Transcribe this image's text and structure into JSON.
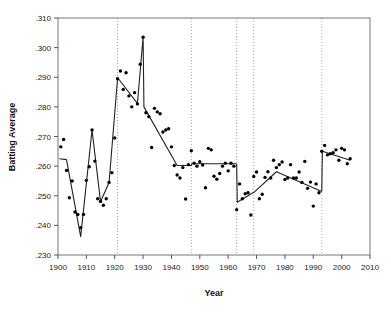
{
  "chart_data": {
    "type": "scatter",
    "title": "",
    "xlabel": "Year",
    "ylabel": "Batting Average",
    "xlim": [
      1900,
      2010
    ],
    "ylim": [
      0.23,
      0.31
    ],
    "xticks": [
      1900,
      1910,
      1920,
      1930,
      1940,
      1950,
      1960,
      1970,
      1980,
      1990,
      2000,
      2010
    ],
    "xtick_labels": [
      "1900",
      "1910",
      "1920",
      "1930",
      "1940",
      "1950",
      "1960",
      "1970",
      "1980",
      "1990",
      "2000",
      "2010"
    ],
    "yticks": [
      0.23,
      0.24,
      0.25,
      0.26,
      0.27,
      0.28,
      0.29,
      0.3,
      0.31
    ],
    "ytick_labels": [
      ".230",
      ".240",
      ".250",
      ".260",
      ".270",
      ".280",
      ".290",
      ".300",
      ".310"
    ],
    "grid": false,
    "legend": "none",
    "changepoints": [
      1921,
      1947,
      1963,
      1969,
      1993
    ],
    "changepoint_style": "dotted-vertical",
    "series": [
      {
        "name": "Observed batting average",
        "marker": "filled-circle",
        "color": "#000000",
        "x": [
          1901,
          1902,
          1903,
          1904,
          1905,
          1906,
          1907,
          1908,
          1909,
          1910,
          1911,
          1912,
          1913,
          1914,
          1915,
          1916,
          1917,
          1918,
          1919,
          1920,
          1921,
          1922,
          1923,
          1924,
          1925,
          1926,
          1927,
          1928,
          1929,
          1930,
          1931,
          1932,
          1933,
          1934,
          1935,
          1936,
          1937,
          1938,
          1939,
          1940,
          1941,
          1942,
          1943,
          1944,
          1945,
          1946,
          1947,
          1948,
          1949,
          1950,
          1951,
          1952,
          1953,
          1954,
          1955,
          1956,
          1957,
          1958,
          1959,
          1960,
          1961,
          1962,
          1963,
          1964,
          1965,
          1966,
          1967,
          1968,
          1969,
          1970,
          1971,
          1972,
          1973,
          1974,
          1975,
          1976,
          1977,
          1978,
          1979,
          1980,
          1981,
          1982,
          1983,
          1984,
          1985,
          1986,
          1987,
          1988,
          1989,
          1990,
          1991,
          1992,
          1993,
          1994,
          1995,
          1996,
          1997,
          1998,
          1999,
          2000,
          2001,
          2002,
          2003
        ],
        "y": [
          0.2665,
          0.269,
          0.2585,
          0.2493,
          0.255,
          0.2445,
          0.2437,
          0.2392,
          0.2437,
          0.2552,
          0.2598,
          0.2722,
          0.2617,
          0.249,
          0.2481,
          0.2468,
          0.249,
          0.2545,
          0.2578,
          0.2695,
          0.2895,
          0.2921,
          0.2859,
          0.2915,
          0.2837,
          0.28,
          0.2848,
          0.281,
          0.2944,
          0.3035,
          0.278,
          0.2767,
          0.2663,
          0.2795,
          0.2783,
          0.2777,
          0.2715,
          0.2722,
          0.2726,
          0.2665,
          0.2602,
          0.257,
          0.256,
          0.2595,
          0.2489,
          0.2605,
          0.2652,
          0.261,
          0.26,
          0.2615,
          0.2604,
          0.2527,
          0.266,
          0.2655,
          0.2566,
          0.2556,
          0.2575,
          0.26,
          0.261,
          0.2584,
          0.261,
          0.26,
          0.2453,
          0.254,
          0.249,
          0.2507,
          0.251,
          0.2435,
          0.2565,
          0.258,
          0.249,
          0.2505,
          0.2562,
          0.2581,
          0.256,
          0.262,
          0.2595,
          0.2605,
          0.2614,
          0.2555,
          0.256,
          0.2605,
          0.256,
          0.256,
          0.258,
          0.2545,
          0.2616,
          0.2525,
          0.2546,
          0.2465,
          0.254,
          0.251,
          0.265,
          0.267,
          0.2638,
          0.2642,
          0.2645,
          0.2655,
          0.262,
          0.266,
          0.2655,
          0.2608,
          0.2625
        ]
      },
      {
        "name": "Segmented piecewise fit",
        "marker": "none",
        "color": "#222222",
        "x": [
          1900.5,
          1903,
          1908,
          1912,
          1915,
          1918,
          1921,
          1921.3,
          1928,
          1930,
          1930.3,
          1942,
          1947,
          1947.2,
          1962.8,
          1963,
          1963.2,
          1969,
          1969.2,
          1977,
          1992.8,
          1993,
          1993.2,
          2003
        ],
        "y": [
          0.2625,
          0.2622,
          0.2362,
          0.2722,
          0.248,
          0.2545,
          0.2895,
          0.2895,
          0.2812,
          0.3035,
          0.28,
          0.2602,
          0.2602,
          0.2608,
          0.2608,
          0.2605,
          0.2478,
          0.2512,
          0.2512,
          0.2581,
          0.2515,
          0.2515,
          0.265,
          0.262
        ]
      }
    ]
  },
  "axis_style": {
    "frame_color": "#777777",
    "tick_color": "#555555",
    "changepoint_color": "#9a9a9a",
    "point_color": "#000000",
    "fit_color": "#222222",
    "background": "#ffffff"
  }
}
